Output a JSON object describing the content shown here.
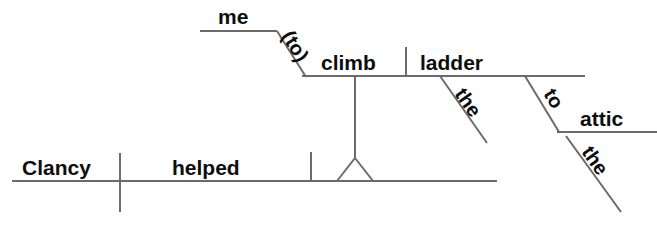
{
  "diagram": {
    "type": "reed-kellogg-sentence-diagram",
    "sentence": "Clancy helped me climb the ladder to the attic.",
    "colors": {
      "line": "#6b6b6b",
      "text": "#0d0d0d",
      "background": "#ffffff"
    },
    "words": {
      "subject": "Clancy",
      "verb": "helped",
      "object_of_infinitive_subject": "me",
      "infinitive_marker": "(to)",
      "infinitive_verb": "climb",
      "infinitive_object": "ladder",
      "article_ladder": "the",
      "preposition": "to",
      "object_of_preposition": "attic",
      "article_attic": "the"
    }
  }
}
